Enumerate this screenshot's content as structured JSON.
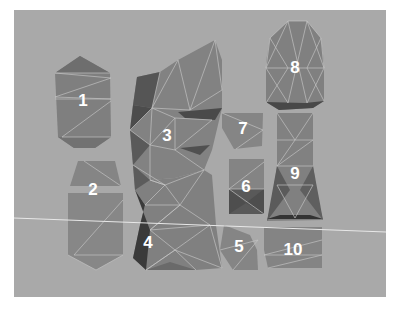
{
  "diagram": {
    "background_color": "#a9a9a9",
    "border_color": "#ffffff",
    "pieces": [
      {
        "id": 1,
        "label": "1"
      },
      {
        "id": 2,
        "label": "2"
      },
      {
        "id": 3,
        "label": "3"
      },
      {
        "id": 4,
        "label": "4"
      },
      {
        "id": 5,
        "label": "5"
      },
      {
        "id": 6,
        "label": "6"
      },
      {
        "id": 7,
        "label": "7"
      },
      {
        "id": 8,
        "label": "8"
      },
      {
        "id": 9,
        "label": "9"
      },
      {
        "id": 10,
        "label": "10"
      }
    ]
  }
}
